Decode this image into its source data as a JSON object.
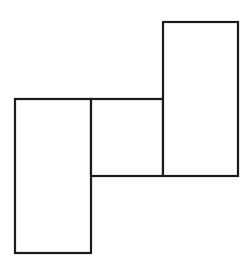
{
  "diagram": {
    "stroke_color": "#1a1a1a",
    "stroke_width": 2.2,
    "fill_color": "#ffffff",
    "shapes": [
      {
        "name": "left-tall-rectangle",
        "x": 15,
        "y": 99,
        "width": 76,
        "height": 154
      },
      {
        "name": "middle-square",
        "x": 91,
        "y": 99,
        "width": 72,
        "height": 77
      },
      {
        "name": "right-tall-rectangle",
        "x": 163,
        "y": 22,
        "width": 75,
        "height": 154
      }
    ]
  }
}
